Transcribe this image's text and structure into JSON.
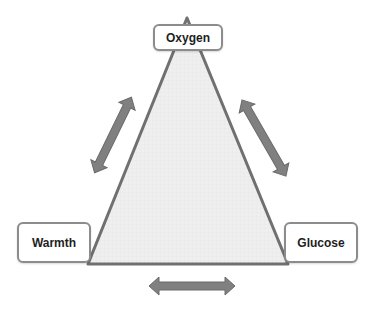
{
  "diagram": {
    "type": "triangle-relationship",
    "nodes": [
      {
        "id": "oxygen",
        "label": "Oxygen",
        "position": "top"
      },
      {
        "id": "warmth",
        "label": "Warmth",
        "position": "bottom-left"
      },
      {
        "id": "glucose",
        "label": "Glucose",
        "position": "bottom-right"
      }
    ],
    "edges": [
      {
        "from": "oxygen",
        "to": "warmth",
        "style": "double-arrow"
      },
      {
        "from": "oxygen",
        "to": "glucose",
        "style": "double-arrow"
      },
      {
        "from": "warmth",
        "to": "glucose",
        "style": "double-arrow"
      }
    ],
    "colors": {
      "triangle_fill": "#ececec",
      "triangle_stroke": "#707070",
      "arrow_fill": "#808080",
      "arrow_stroke": "#6a6a6a",
      "box_border": "#8c8c8c"
    }
  }
}
